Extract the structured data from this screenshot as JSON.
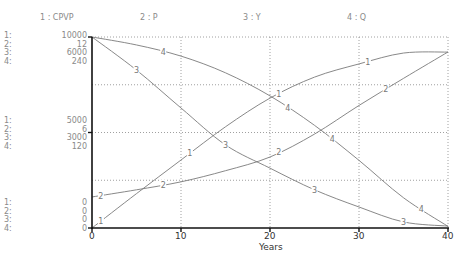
{
  "legend": [
    {
      "label": "1 : CPVP"
    },
    {
      "label": "2 : P"
    },
    {
      "label": "3 : Y"
    },
    {
      "label": "4 : Q"
    }
  ],
  "y_axes": {
    "top": {
      "indices": [
        "1:",
        "2:",
        "3:",
        "4:"
      ],
      "values": [
        "10000",
        "12",
        "6000",
        "240"
      ]
    },
    "middle": {
      "indices": [
        "1:",
        "2:",
        "3:",
        "4:"
      ],
      "values": [
        "5000",
        "6",
        "3000",
        "120"
      ]
    },
    "bottom": {
      "indices": [
        "1:",
        "2:",
        "3:",
        "4:"
      ],
      "values": [
        "0",
        "0",
        "0",
        "0"
      ]
    }
  },
  "x_axis": {
    "ticks": [
      "0",
      "10",
      "20",
      "30",
      "40"
    ],
    "label": "Years"
  },
  "chart_data": {
    "type": "line",
    "title": "",
    "xlabel": "Years",
    "ylabel": "",
    "xlim": [
      0,
      40
    ],
    "grid": true,
    "legend_position": "top",
    "x": [
      0,
      5,
      10,
      15,
      20,
      25,
      30,
      35,
      40
    ],
    "series": [
      {
        "name": "CPVP",
        "index": 1,
        "ylim": [
          0,
          10000
        ],
        "values": [
          0,
          1800,
          3560,
          5300,
          6800,
          7900,
          8590,
          9160,
          9210
        ]
      },
      {
        "name": "P",
        "index": 2,
        "ylim": [
          0,
          12
        ],
        "values": [
          1.95,
          2.4,
          2.9,
          3.6,
          4.46,
          5.9,
          7.7,
          9.4,
          11.06
        ]
      },
      {
        "name": "Y",
        "index": 3,
        "ylim": [
          0,
          6000
        ],
        "values": [
          6000,
          4960,
          3770,
          2610,
          1880,
          1200,
          660,
          190,
          60
        ]
      },
      {
        "name": "Q",
        "index": 4,
        "ylim": [
          0,
          240
        ],
        "values": [
          240,
          230,
          216,
          195,
          166,
          129,
          85,
          38,
          2
        ]
      }
    ]
  }
}
